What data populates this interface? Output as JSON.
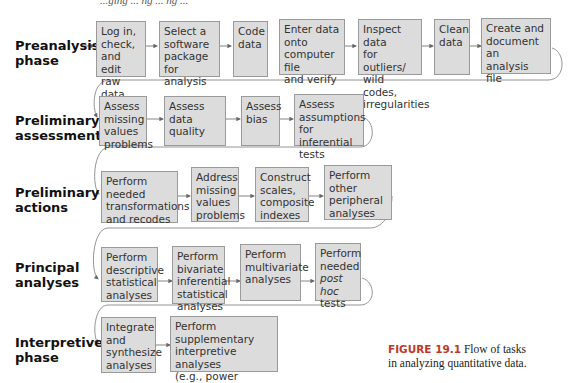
{
  "top_cut_text": "...ging ... ng ... ng ...",
  "phases": [
    {
      "label": "Preanalysis\nphase",
      "steps": [
        "Log in,\ncheck,\nand edit\nraw data",
        "Select a\nsoftware\npackage\nfor analysis",
        "Code\ndata",
        "Enter data\nonto\ncomputer file\nand verify",
        "Inspect data\nfor outliers/\nwild codes,\nirregularities",
        "Clean\ndata",
        "Create and\ndocument an\nanalysis file"
      ]
    },
    {
      "label": "Preliminary\nassessments",
      "steps": [
        "Assess\nmissing\nvalues\nproblems",
        "Assess data\nquality",
        "Assess\nbias",
        "Assess\nassumptions\nfor inferential\ntests"
      ]
    },
    {
      "label": "Preliminary\nactions",
      "steps": [
        "Perform\nneeded\ntransformations\nand recodes",
        "Address\nmissing\nvalues\nproblems",
        "Construct\nscales,\ncomposite\nindexes",
        "Perform other\nperipheral\nanalyses"
      ]
    },
    {
      "label": "Principal\nanalyses",
      "steps": [
        "Perform\ndescriptive\nstatistical\nanalyses",
        "Perform\nbivariate\ninferential\nstatistical\nanalyses",
        "Perform\nmultivariate\nanalyses",
        "Perform\nneeded\npost hoc\ntests"
      ]
    },
    {
      "label": "Interpretive\nphase",
      "steps": [
        "Integrate\nand\nsynthesize\nanalyses",
        "Perform\nsupplementary\ninterpretive analyses\n(e.g., power analysis)"
      ]
    }
  ],
  "caption": {
    "figure_number": "FIGURE 19.1",
    "text": "Flow of tasks\nin analyzing quantitative data."
  }
}
